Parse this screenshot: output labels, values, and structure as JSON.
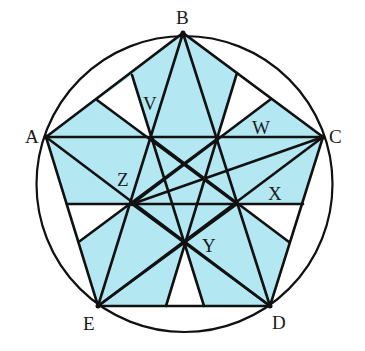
{
  "diagram": {
    "type": "pentagon-in-circle with pentagram and shaded regions",
    "fill_color": "#b3e8f2",
    "line_color": "#111111",
    "circle": {
      "cx": 184.5,
      "cy": 184,
      "r": 148
    },
    "vertices": {
      "A": {
        "label": "A",
        "x": 46,
        "y": 137
      },
      "B": {
        "label": "B",
        "x": 183,
        "y": 33
      },
      "C": {
        "label": "C",
        "x": 323,
        "y": 137
      },
      "D": {
        "label": "D",
        "x": 270,
        "y": 306
      },
      "E": {
        "label": "E",
        "x": 98,
        "y": 306
      }
    },
    "inner_points": {
      "P_AB": {
        "x": 152,
        "y": 139
      },
      "P_BC": {
        "x": 217,
        "y": 139
      },
      "P_CD": {
        "x": 237,
        "y": 204
      },
      "P_DE": {
        "x": 184,
        "y": 242
      },
      "P_EA": {
        "x": 132,
        "y": 204
      }
    },
    "region_labels": {
      "V": {
        "label": "V",
        "x": 151,
        "y": 109
      },
      "W": {
        "label": "W",
        "x": 262,
        "y": 134
      },
      "X": {
        "label": "X",
        "x": 276,
        "y": 199
      },
      "Y": {
        "label": "Y",
        "x": 208,
        "y": 250
      },
      "Z": {
        "label": "Z",
        "x": 124,
        "y": 185
      }
    }
  }
}
